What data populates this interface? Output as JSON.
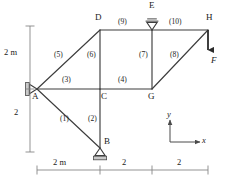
{
  "figure": {
    "stroke_color": "#3d3d3d",
    "text_color": "#1a1a1a",
    "dim_color": "#6b6b6b"
  },
  "nodes": [
    {
      "id": "A",
      "label": "A",
      "x": 37,
      "y": 89,
      "lx": 32,
      "ly": 92
    },
    {
      "id": "B",
      "label": "B",
      "x": 100,
      "y": 148,
      "lx": 104,
      "ly": 138
    },
    {
      "id": "C",
      "label": "C",
      "x": 100,
      "y": 89,
      "lx": 101,
      "ly": 92
    },
    {
      "id": "D",
      "label": "D",
      "x": 100,
      "y": 30,
      "lx": 95,
      "ly": 14
    },
    {
      "id": "E",
      "label": "E",
      "x": 152,
      "y": 30,
      "lx": 149,
      "ly": 2
    },
    {
      "id": "G",
      "label": "G",
      "x": 152,
      "y": 89,
      "lx": 148,
      "ly": 92
    },
    {
      "id": "H",
      "label": "H",
      "x": 208,
      "y": 30,
      "lx": 207,
      "ly": 14
    }
  ],
  "members": [
    {
      "id": 1,
      "label": "(1)",
      "from": "A",
      "to": "B",
      "lx": 60,
      "ly": 119
    },
    {
      "id": 2,
      "label": "(2)",
      "from": "C",
      "to": "B",
      "lx": 88,
      "ly": 119
    },
    {
      "id": 3,
      "label": "(3)",
      "from": "A",
      "to": "C",
      "lx": 63,
      "ly": 78
    },
    {
      "id": 4,
      "label": "(4)",
      "from": "C",
      "to": "G",
      "lx": 119,
      "ly": 78
    },
    {
      "id": 5,
      "label": "(5)",
      "from": "A",
      "to": "D",
      "lx": 56,
      "ly": 54
    },
    {
      "id": 6,
      "label": "(6)",
      "from": "D",
      "to": "C",
      "lx": 88,
      "ly": 54
    },
    {
      "id": 7,
      "label": "(7)",
      "from": "E",
      "to": "G",
      "lx": 140,
      "ly": 54
    },
    {
      "id": 8,
      "label": "(8)",
      "from": "G",
      "to": "H",
      "lx": 171,
      "ly": 54
    },
    {
      "id": 9,
      "label": "(9)",
      "from": "D",
      "to": "E",
      "lx": 119,
      "ly": 19
    },
    {
      "id": 10,
      "label": "(10)",
      "from": "E",
      "to": "H",
      "lx": 172,
      "ly": 19
    }
  ],
  "supports": [
    {
      "at": "A",
      "kind": "pin-wall-left"
    },
    {
      "at": "B",
      "kind": "roller-ground"
    },
    {
      "at": "E",
      "kind": "roller-ceiling"
    }
  ],
  "load": {
    "label": "F",
    "at": "H",
    "direction": "down",
    "lx": 212,
    "ly": 60
  },
  "dimensions": {
    "vertical": {
      "segments": [
        {
          "label": "2 m",
          "lx": 5,
          "ly": 52
        },
        {
          "label": "2",
          "lx": 14,
          "ly": 112
        }
      ]
    },
    "horizontal": {
      "segments": [
        {
          "label": "2 m",
          "lx": 53,
          "ly": 161
        },
        {
          "label": "2",
          "lx": 123,
          "ly": 161
        },
        {
          "label": "2",
          "lx": 177,
          "ly": 161
        }
      ]
    }
  },
  "axes": {
    "x_label": "x",
    "y_label": "y",
    "x_lx": 205,
    "x_ly": 139,
    "y_lx": 168,
    "y_ly": 110
  }
}
